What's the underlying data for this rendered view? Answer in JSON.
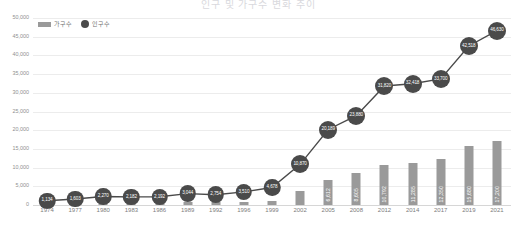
{
  "title": "인구 및 가구수 변화 추이",
  "legend": {
    "position": "top-left",
    "items": [
      {
        "key": "households",
        "label": "가구수",
        "icon": "bar-swatch-icon",
        "color": "#9a9a9a"
      },
      {
        "key": "population",
        "label": "인구수",
        "icon": "circle-marker-icon",
        "color": "#4a4a4a"
      }
    ]
  },
  "chart_data": {
    "type": "bar",
    "title": "인구 및 가구수 변화 추이",
    "xlabel": "",
    "ylabel": "",
    "ylim": [
      0,
      50000
    ],
    "ytick_step": 5000,
    "grid": true,
    "legend_position": "top-left",
    "categories": [
      "1974",
      "1977",
      "1980",
      "1983",
      "1986",
      "1989",
      "1992",
      "1996",
      "1999",
      "2002",
      "2005",
      "2008",
      "2012",
      "2014",
      "2017",
      "2019",
      "2021"
    ],
    "ytick_labels": [
      "0",
      "5,000",
      "10,000",
      "15,000",
      "20,000",
      "25,000",
      "30,000",
      "35,000",
      "40,000",
      "45,000",
      "50,000"
    ],
    "series": [
      {
        "name": "인구수",
        "type": "line",
        "color": "#4a4a4a",
        "values": [
          1134,
          1603,
          2270,
          2182,
          2192,
          3044,
          2754,
          3510,
          4678,
          10870,
          20189,
          23880,
          31820,
          32418,
          33700,
          42518,
          46630
        ],
        "labels": [
          "1,134",
          "1,603",
          "2,270",
          "2,182",
          "2,192",
          "3,044",
          "2,754",
          "3,510",
          "4,678",
          "10,870",
          "20,189",
          "23,880",
          "31,820",
          "32,418",
          "33,700",
          "42,518",
          "46,630"
        ]
      },
      {
        "name": "가구수",
        "type": "bar",
        "color": "#9a9a9a",
        "values": [
          330,
          450,
          620,
          610,
          640,
          800,
          760,
          900,
          1180,
          3756,
          6612,
          8605,
          10792,
          11285,
          12350,
          15680,
          17200
        ],
        "labels": [
          "330",
          "450",
          "620",
          "610",
          "640",
          "800",
          "760",
          "900",
          "1,180",
          "3,756",
          "6,612",
          "8,605",
          "10,792",
          "11,285",
          "12,350",
          "15,680",
          "17,200"
        ]
      }
    ]
  }
}
